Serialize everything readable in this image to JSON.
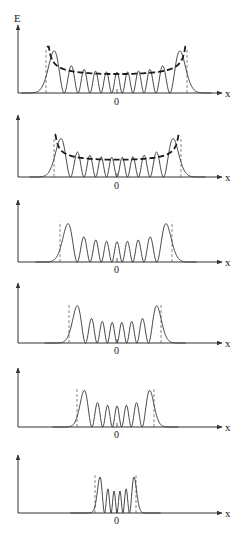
{
  "figure": {
    "y_axis_label": "E",
    "x_axis_label": "x",
    "origin_label": "0",
    "colors": {
      "wavefunction": "#333333",
      "classical_probability": "#1a1a1a",
      "axis": "#333333",
      "turning_point": "#555555"
    }
  },
  "chart_data": {
    "type": "line",
    "title": "",
    "xlabel": "x",
    "ylabel": "E",
    "panels": [
      {
        "index": 0,
        "n": 10,
        "peaks": 6,
        "baseline_y": 93,
        "axis_top": 25,
        "turning_points_px": [
          46,
          187
        ],
        "zero_label_y": 104
      },
      {
        "index": 1,
        "n": 9,
        "peaks": 5,
        "baseline_y": 177,
        "axis_top": 115,
        "turning_points_px": [
          54,
          181
        ],
        "zero_label_y": 188
      },
      {
        "index": 2,
        "n": 8,
        "peaks": 4,
        "baseline_y": 262,
        "axis_top": 200,
        "turning_points_px": [
          60,
          172
        ],
        "zero_label_y": 272
      },
      {
        "index": 3,
        "n": 7,
        "peaks": 3,
        "baseline_y": 343,
        "axis_top": 283,
        "turning_points_px": [
          69,
          161
        ],
        "zero_label_y": 353
      },
      {
        "index": 4,
        "n": 6,
        "peaks": 2,
        "baseline_y": 427,
        "axis_top": 368,
        "turning_points_px": [
          77,
          154
        ],
        "zero_label_y": 437
      },
      {
        "index": 5,
        "n": 5,
        "peaks": 1,
        "baseline_y": 513,
        "axis_top": 455,
        "turning_points_px": [
          95,
          136
        ],
        "zero_label_y": 523
      }
    ]
  }
}
